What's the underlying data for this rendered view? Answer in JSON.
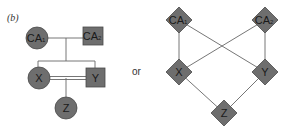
{
  "panel_label": "(b)",
  "separator": "or",
  "colors": {
    "node_fill": "#6e6e6e",
    "edge": "#666666",
    "text": "#1a1a1a"
  },
  "left_graph": {
    "nodes": [
      {
        "id": "CA1",
        "label": "CA",
        "sub": "1",
        "shape": "circle"
      },
      {
        "id": "CA2",
        "label": "CA",
        "sub": "2",
        "shape": "square"
      },
      {
        "id": "X",
        "label": "X",
        "shape": "circle"
      },
      {
        "id": "Y",
        "label": "Y",
        "shape": "square"
      },
      {
        "id": "Z",
        "label": "Z",
        "shape": "circle"
      }
    ],
    "edges": [
      {
        "from": "CA1",
        "to": "CA2",
        "type": "mating"
      },
      {
        "from": "CA1-CA2",
        "to": [
          "X",
          "Y"
        ],
        "type": "offspring"
      },
      {
        "from": "X",
        "to": "Y",
        "type": "consanguineous-mating"
      },
      {
        "from": "X-Y",
        "to": "Z",
        "type": "offspring"
      }
    ]
  },
  "right_graph": {
    "nodes": [
      {
        "id": "CA1",
        "label": "CA",
        "sub": "1",
        "shape": "diamond"
      },
      {
        "id": "CA2",
        "label": "CA",
        "sub": "2",
        "shape": "diamond"
      },
      {
        "id": "X",
        "label": "X",
        "shape": "diamond"
      },
      {
        "id": "Y",
        "label": "Y",
        "shape": "diamond"
      },
      {
        "id": "Z",
        "label": "Z",
        "shape": "diamond"
      }
    ],
    "edges": [
      {
        "from": "CA1",
        "to": "X"
      },
      {
        "from": "CA1",
        "to": "Y"
      },
      {
        "from": "CA2",
        "to": "X"
      },
      {
        "from": "CA2",
        "to": "Y"
      },
      {
        "from": "X",
        "to": "Z"
      },
      {
        "from": "Y",
        "to": "Z"
      }
    ]
  }
}
